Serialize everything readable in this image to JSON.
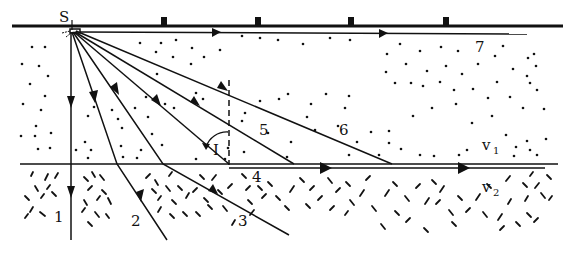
{
  "figure": {
    "type": "seismic ray path diagram",
    "source_label": "S",
    "angle_label": "I",
    "layers": [
      {
        "name": "upper layer",
        "velocity_label": "v",
        "velocity_sub": "1",
        "texture": "dots"
      },
      {
        "name": "lower layer",
        "velocity_label": "v",
        "velocity_sub": "2",
        "texture": "dashes"
      }
    ],
    "ray_labels": {
      "r1": "1",
      "r2": "2",
      "r3": "3",
      "r4": "4",
      "r5": "5",
      "r6": "6",
      "r7": "7"
    },
    "geophone_count": 4,
    "colors": {
      "ink": "#111111",
      "background": "#ffffff"
    }
  }
}
